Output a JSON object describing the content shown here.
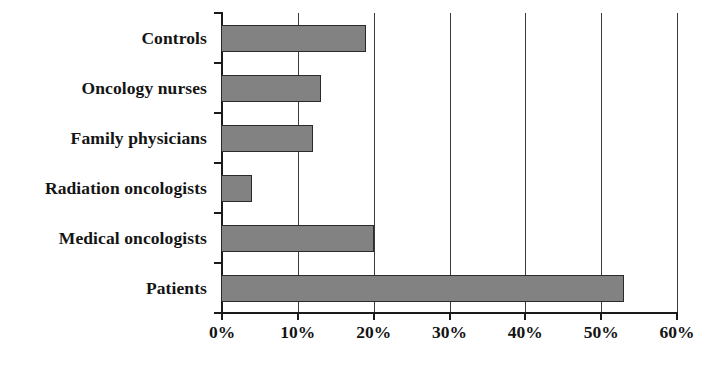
{
  "chart_data": {
    "type": "bar",
    "orientation": "horizontal",
    "title": "",
    "subtitle": "",
    "xlabel": "",
    "ylabel": "",
    "categories": [
      "Controls",
      "Oncology nurses",
      "Family physicians",
      "Radiation oncologists",
      "Medical oncologists",
      "Patients"
    ],
    "values": [
      19,
      13,
      12,
      4,
      20,
      53
    ],
    "value_unit": "%",
    "xlim": [
      0,
      60
    ],
    "xticks": [
      0,
      10,
      20,
      30,
      40,
      50,
      60
    ],
    "xtick_labels": [
      "0%",
      "10%",
      "20%",
      "30%",
      "40%",
      "50%",
      "60%"
    ],
    "grid": "vertical",
    "legend": "none",
    "series": [
      {
        "name": "",
        "values": [
          19,
          13,
          12,
          4,
          20,
          53
        ]
      }
    ],
    "colors": {
      "bar_fill": "#828282",
      "bar_border": "#2a2a2a",
      "axis": "#1a1a1a",
      "gridline": "#3b3b3b",
      "text": "#141414",
      "background": "#ffffff"
    }
  }
}
